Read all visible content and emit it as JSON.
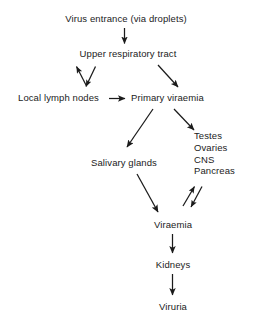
{
  "diagram": {
    "title": "Virus entrance (via droplets)",
    "background_color": "#ffffff",
    "text_color": "#1b1b1b",
    "arrow_color": "#1b1b1b",
    "nodes": {
      "virus_entrance": "Virus entrance (via droplets)",
      "upper_respiratory_tract": "Upper respiratory tract",
      "local_lymph_nodes": "Local lymph nodes",
      "primary_viraemia": "Primary viraemia",
      "salivary_glands": "Salivary glands",
      "viraemia": "Viraemia",
      "kidneys": "Kidneys",
      "viruria": "Viruria"
    },
    "organ_targets": [
      "Testes",
      "Ovaries",
      "CNS",
      "Pancreas"
    ],
    "edges": [
      {
        "from": "virus_entrance",
        "to": "upper_respiratory_tract",
        "style": "vertical-down"
      },
      {
        "from": "upper_respiratory_tract",
        "to": "local_lymph_nodes",
        "style": "diagonal-bidirectional"
      },
      {
        "from": "local_lymph_nodes",
        "to": "primary_viraemia",
        "style": "horizontal-right"
      },
      {
        "from": "upper_respiratory_tract",
        "to": "primary_viraemia",
        "style": "diagonal-down-right"
      },
      {
        "from": "primary_viraemia",
        "to": "salivary_glands",
        "style": "diagonal-down-left"
      },
      {
        "from": "primary_viraemia",
        "to": "organ_targets",
        "style": "diagonal-down-right"
      },
      {
        "from": "salivary_glands",
        "to": "viraemia",
        "style": "diagonal-down-right"
      },
      {
        "from": "organ_targets",
        "to": "viraemia",
        "style": "diagonal-bidirectional"
      },
      {
        "from": "viraemia",
        "to": "kidneys",
        "style": "vertical-down"
      },
      {
        "from": "kidneys",
        "to": "viruria",
        "style": "vertical-down"
      }
    ]
  }
}
